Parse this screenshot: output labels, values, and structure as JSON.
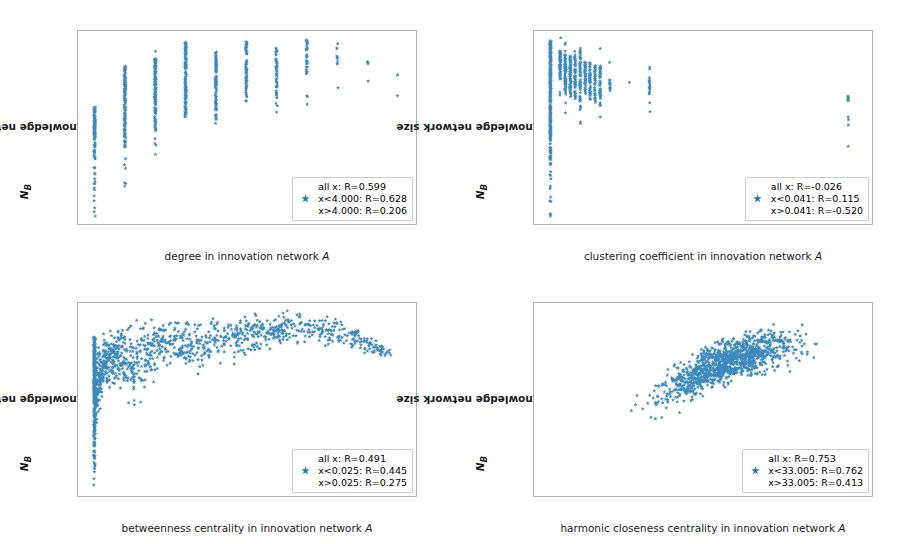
{
  "figure": {
    "marker_color": "#1f77b4",
    "marker_symbol": "star",
    "background": "#ffffff",
    "layout": "2x2 grid of scatter panels"
  },
  "chart_data": [
    {
      "type": "scatter",
      "title": "",
      "xlabel": "degree in innovation network A",
      "xlabel_plain": "degree in innovation network",
      "xlabel_italic": "A",
      "ylabel": "knowledge network size N_B",
      "ylabel_plain": "knowledge network size ",
      "ylabel_italic": "N",
      "ylabel_subscript": "B",
      "xlim": [
        0.45,
        11.6
      ],
      "ylim": [
        5050,
        5840
      ],
      "xticks": [
        2,
        4,
        6,
        8,
        10
      ],
      "xticklabels": [
        "2",
        "4",
        "6",
        "8",
        "10"
      ],
      "yticks": [
        5100,
        5200,
        5300,
        5400,
        5500,
        5600,
        5700,
        5800
      ],
      "yticklabels": [
        "5100",
        "5200",
        "5300",
        "5400",
        "5500",
        "5600",
        "5700",
        "5800"
      ],
      "grid": false,
      "legend_position": "lower right",
      "legend": [
        "all x: R=0.599",
        "x<4.000: R=0.628",
        "x>4.000: R=0.206"
      ],
      "correlations": {
        "all_x": 0.599,
        "split_value": 4.0,
        "below_split": 0.628,
        "above_split": 0.206
      },
      "series": [
        {
          "name": "degree vs knowledge network size",
          "color": "#1f77b4",
          "marker": "star",
          "x_groups": [
            1,
            2,
            3,
            4,
            5,
            6,
            7,
            8,
            9,
            10,
            11
          ],
          "group_y_ranges": [
            {
              "x": 1,
              "ymin": 5082,
              "ymax": 5528,
              "n": 120,
              "dense_from": 5310,
              "dense_to": 5528,
              "outliers": [
                5082,
                5145,
                5165,
                5215,
                5235,
                5280
              ]
            },
            {
              "x": 2,
              "ymin": 5205,
              "ymax": 5700,
              "n": 150,
              "dense_from": 5360,
              "dense_to": 5700,
              "outliers": [
                5205,
                5278,
                5318
              ]
            },
            {
              "x": 3,
              "ymin": 5335,
              "ymax": 5757,
              "n": 150,
              "dense_from": 5425,
              "dense_to": 5728,
              "outliers": [
                5335,
                5380,
                5757
              ]
            },
            {
              "x": 4,
              "ymin": 5458,
              "ymax": 5795,
              "n": 130,
              "dense_from": 5458,
              "dense_to": 5795,
              "outliers": []
            },
            {
              "x": 5,
              "ymin": 5462,
              "ymax": 5755,
              "n": 95,
              "dense_from": 5482,
              "dense_to": 5755,
              "outliers": [
                5462
              ]
            },
            {
              "x": 6,
              "ymin": 5538,
              "ymax": 5798,
              "n": 70,
              "dense_from": 5538,
              "dense_to": 5798,
              "outliers": []
            },
            {
              "x": 7,
              "ymin": 5508,
              "ymax": 5772,
              "n": 50,
              "dense_from": 5555,
              "dense_to": 5772,
              "outliers": [
                5508
              ]
            },
            {
              "x": 8,
              "ymin": 5540,
              "ymax": 5810,
              "n": 34,
              "dense_from": 5625,
              "dense_to": 5810,
              "outliers": [
                5540,
                5575
              ]
            },
            {
              "x": 9,
              "ymin": 5608,
              "ymax": 5788,
              "n": 8,
              "dense_from": 5705,
              "dense_to": 5742,
              "outliers": [
                5608,
                5788
              ]
            },
            {
              "x": 10,
              "ymin": 5635,
              "ymax": 5715,
              "n": 4,
              "dense_from": 5705,
              "dense_to": 5715,
              "outliers": [
                5635
              ]
            },
            {
              "x": 11,
              "ymin": 5575,
              "ymax": 5660,
              "n": 2,
              "dense_from": 5660,
              "dense_to": 5660,
              "outliers": [
                5575
              ]
            }
          ]
        }
      ]
    },
    {
      "type": "scatter",
      "title": "",
      "xlabel": "clustering coefficient in innovation network A",
      "xlabel_plain": "clustering coefficient in innovation network",
      "xlabel_italic": "A",
      "ylabel": "knowledge network size N_B",
      "ylabel_plain": "knowledge network size ",
      "ylabel_italic": "N",
      "ylabel_subscript": "B",
      "xlim": [
        -0.055,
        1.08
      ],
      "ylim": [
        5050,
        5840
      ],
      "xticks": [
        0.0,
        0.2,
        0.4,
        0.6,
        0.8,
        1.0
      ],
      "xticklabels": [
        "0.0",
        "0.2",
        "0.4",
        "0.6",
        "0.8",
        "1.0"
      ],
      "yticks": [
        5100,
        5200,
        5300,
        5400,
        5500,
        5600,
        5700,
        5800
      ],
      "yticklabels": [
        "5100",
        "5200",
        "5300",
        "5400",
        "5500",
        "5600",
        "5700",
        "5800"
      ],
      "grid": false,
      "legend_position": "lower right",
      "legend": [
        "all x: R=-0.026",
        "x<0.041: R=0.115",
        "x>0.041: R=-0.520"
      ],
      "correlations": {
        "all_x": -0.026,
        "split_value": 0.041,
        "below_split": 0.115,
        "above_split": -0.52
      },
      "series": [
        {
          "name": "clustering coefficient vs knowledge network size",
          "color": "#1f77b4",
          "marker": "star",
          "x_groups": [
            0.0,
            0.033,
            0.05,
            0.067,
            0.083,
            0.1,
            0.117,
            0.133,
            0.15,
            0.167,
            0.2,
            0.267,
            0.333,
            1.0
          ],
          "group_y_ranges": [
            {
              "x": 0.0,
              "ymin": 5082,
              "ymax": 5802,
              "n": 330,
              "dense_from": 5290,
              "dense_to": 5802,
              "outliers": [
                5082,
                5145,
                5160,
                5205,
                5235
              ]
            },
            {
              "x": 0.033,
              "ymin": 5565,
              "ymax": 5812,
              "n": 70,
              "dense_from": 5640,
              "dense_to": 5760,
              "outliers": [
                5812
              ]
            },
            {
              "x": 0.05,
              "ymin": 5505,
              "ymax": 5790,
              "n": 80,
              "dense_from": 5580,
              "dense_to": 5745,
              "outliers": [
                5505,
                5790
              ]
            },
            {
              "x": 0.067,
              "ymin": 5540,
              "ymax": 5765,
              "n": 70,
              "dense_from": 5570,
              "dense_to": 5740,
              "outliers": []
            },
            {
              "x": 0.083,
              "ymin": 5535,
              "ymax": 5760,
              "n": 60,
              "dense_from": 5560,
              "dense_to": 5745,
              "outliers": []
            },
            {
              "x": 0.1,
              "ymin": 5462,
              "ymax": 5770,
              "n": 65,
              "dense_from": 5520,
              "dense_to": 5765,
              "outliers": [
                5462
              ]
            },
            {
              "x": 0.117,
              "ymin": 5560,
              "ymax": 5740,
              "n": 45,
              "dense_from": 5570,
              "dense_to": 5715,
              "outliers": []
            },
            {
              "x": 0.133,
              "ymin": 5530,
              "ymax": 5715,
              "n": 45,
              "dense_from": 5555,
              "dense_to": 5710,
              "outliers": []
            },
            {
              "x": 0.15,
              "ymin": 5525,
              "ymax": 5705,
              "n": 35,
              "dense_from": 5545,
              "dense_to": 5700,
              "outliers": []
            },
            {
              "x": 0.167,
              "ymin": 5488,
              "ymax": 5768,
              "n": 40,
              "dense_from": 5530,
              "dense_to": 5705,
              "outliers": [
                5488,
                5768
              ]
            },
            {
              "x": 0.2,
              "ymin": 5568,
              "ymax": 5712,
              "n": 12,
              "dense_from": 5595,
              "dense_to": 5640,
              "outliers": [
                5712
              ]
            },
            {
              "x": 0.267,
              "ymin": 5630,
              "ymax": 5630,
              "n": 1,
              "dense_from": 5630,
              "dense_to": 5630,
              "outliers": [
                5630
              ]
            },
            {
              "x": 0.333,
              "ymin": 5510,
              "ymax": 5692,
              "n": 16,
              "dense_from": 5570,
              "dense_to": 5650,
              "outliers": [
                5510,
                5692
              ]
            },
            {
              "x": 1.0,
              "ymin": 5368,
              "ymax": 5575,
              "n": 12,
              "dense_from": 5540,
              "dense_to": 5575,
              "outliers": [
                5368,
                5455,
                5488
              ]
            }
          ]
        }
      ]
    },
    {
      "type": "scatter",
      "title": "",
      "xlabel": "betweenness centrality in innovation network A",
      "xlabel_plain": "betweenness centrality in innovation network",
      "xlabel_italic": "A",
      "ylabel": "knowledge network size N_B",
      "ylabel_plain": "knowledge network size ",
      "ylabel_italic": "N",
      "ylabel_subscript": "B",
      "xlim": [
        -0.0075,
        0.1475
      ],
      "ylim": [
        5050,
        5840
      ],
      "xticks": [
        0.0,
        0.02,
        0.04,
        0.06,
        0.08,
        0.1,
        0.12,
        0.14
      ],
      "xticklabels": [
        "0.00",
        "0.02",
        "0.04",
        "0.06",
        "0.08",
        "0.10",
        "0.12",
        "0.14"
      ],
      "yticks": [
        5100,
        5200,
        5300,
        5400,
        5500,
        5600,
        5700,
        5800
      ],
      "yticklabels": [
        "5100",
        "5200",
        "5300",
        "5400",
        "5500",
        "5600",
        "5700",
        "5800"
      ],
      "grid": false,
      "legend_position": "lower right",
      "legend": [
        "all x: R=0.491",
        "x<0.025: R=0.445",
        "x>0.025: R=0.275"
      ],
      "correlations": {
        "all_x": 0.491,
        "split_value": 0.025,
        "below_split": 0.445,
        "above_split": 0.275
      },
      "series": [
        {
          "name": "betweenness centrality vs knowledge network size",
          "color": "#1f77b4",
          "marker": "star",
          "cloud": {
            "n_points": 1100,
            "x_range": [
              0.0,
              0.136
            ],
            "y_range": [
              5082,
              5815
            ],
            "description": "dense saturating cloud rising steeply from x=0 then plateauing near y=5700; vertical spike of points at x=0 spanning 5082-5700",
            "spike_at_zero": {
              "x": 0.0,
              "ymin": 5082,
              "ymax": 5700,
              "n": 260
            },
            "upper_envelope": [
              [
                0.0,
                5700
              ],
              [
                0.01,
                5760
              ],
              [
                0.02,
                5780
              ],
              [
                0.04,
                5790
              ],
              [
                0.06,
                5795
              ],
              [
                0.09,
                5815
              ],
              [
                0.11,
                5790
              ],
              [
                0.136,
                5660
              ]
            ],
            "lower_envelope": [
              [
                0.0,
                5082
              ],
              [
                0.005,
                5370
              ],
              [
                0.01,
                5375
              ],
              [
                0.02,
                5205
              ],
              [
                0.03,
                5470
              ],
              [
                0.045,
                5435
              ],
              [
                0.065,
                5510
              ],
              [
                0.09,
                5595
              ],
              [
                0.11,
                5610
              ],
              [
                0.125,
                5575
              ]
            ]
          }
        }
      ]
    },
    {
      "type": "scatter",
      "title": "",
      "xlabel": "harmonic closeness centrality in innovation network A",
      "xlabel_plain": "harmonic closeness centrality in innovation network",
      "xlabel_italic": "A",
      "ylabel": "knowledge network size N_B",
      "ylabel_plain": "knowledge network size ",
      "ylabel_italic": "N",
      "ylabel_subscript": "B",
      "xlim": [
        17.5,
        44.2
      ],
      "ylim": [
        5050,
        5840
      ],
      "xticks": [
        20,
        25,
        30,
        35,
        40
      ],
      "xticklabels": [
        "20",
        "25",
        "30",
        "35",
        "40"
      ],
      "yticks": [
        5100,
        5200,
        5300,
        5400,
        5500,
        5600,
        5700,
        5800
      ],
      "yticklabels": [
        "5100",
        "5200",
        "5300",
        "5400",
        "5500",
        "5600",
        "5700",
        "5800"
      ],
      "grid": false,
      "legend_position": "lower right",
      "legend": [
        "all x: R=0.753",
        "x<33.005: R=0.762",
        "x>33.005: R=0.413"
      ],
      "correlations": {
        "all_x": 0.753,
        "split_value": 33.005,
        "below_split": 0.762,
        "above_split": 0.413
      },
      "series": [
        {
          "name": "harmonic closeness centrality vs knowledge network size",
          "color": "#1f77b4",
          "marker": "star",
          "cloud": {
            "n_points": 1100,
            "x_range": [
              18.7,
              43.3
            ],
            "y_range": [
              5082,
              5812
            ],
            "description": "broad positively-sloped elongated cloud, tightening and flattening above x=35",
            "trend": [
              [
                18.7,
                5082
              ],
              [
                21,
                5200
              ],
              [
                23,
                5340
              ],
              [
                25,
                5430
              ],
              [
                28,
                5520
              ],
              [
                31,
                5590
              ],
              [
                34,
                5630
              ],
              [
                37,
                5670
              ],
              [
                40,
                5700
              ],
              [
                43,
                5700
              ]
            ],
            "upper_envelope": [
              [
                19,
                5100
              ],
              [
                22,
                5410
              ],
              [
                25,
                5500
              ],
              [
                28,
                5620
              ],
              [
                31,
                5700
              ],
              [
                34,
                5760
              ],
              [
                37,
                5795
              ],
              [
                40,
                5800
              ],
              [
                41.3,
                5812
              ],
              [
                43.3,
                5715
              ]
            ],
            "lower_envelope": [
              [
                18.7,
                5082
              ],
              [
                21,
                5145
              ],
              [
                22,
                5170
              ],
              [
                23.2,
                5280
              ],
              [
                25,
                5330
              ],
              [
                27,
                5280
              ],
              [
                29,
                5320
              ],
              [
                31,
                5425
              ],
              [
                34,
                5465
              ],
              [
                37,
                5510
              ],
              [
                40,
                5545
              ],
              [
                43,
                5605
              ]
            ]
          }
        }
      ]
    }
  ]
}
